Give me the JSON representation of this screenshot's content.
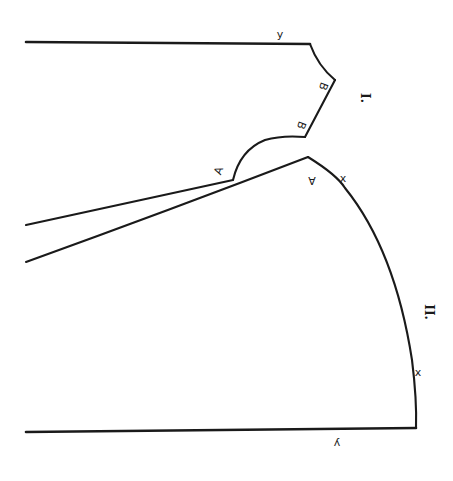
{
  "diagram": {
    "pieces": [
      {
        "id": "piece-1",
        "label": "I."
      },
      {
        "id": "piece-2",
        "label": "II."
      }
    ],
    "labels": {
      "y_top": "y",
      "y_bottom": "y",
      "b_upper": "B",
      "b_lower": "B",
      "a_left": "A",
      "a_right": "A",
      "x_upper": "x",
      "x_lower": "x",
      "piece_1": "I.",
      "piece_2": "II."
    },
    "colors": {
      "line": "#1a1a1a",
      "background": "#ffffff"
    }
  }
}
